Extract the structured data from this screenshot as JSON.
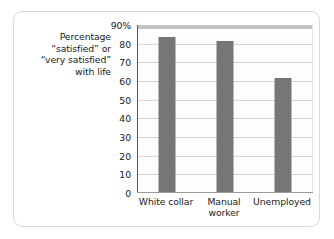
{
  "chart_data": {
    "type": "bar",
    "title": "",
    "subtitle": "",
    "xlabel": "",
    "ylabel": "Percentage “satisfied” or “very satisfied” with life",
    "ylabel_lines": [
      "Percentage",
      "“satisfied” or",
      "“very satisfied”",
      "with life"
    ],
    "categories": [
      "White collar",
      "Manual worker",
      "Unemployed"
    ],
    "category_label_lines": [
      [
        "White collar"
      ],
      [
        "Manual",
        "worker"
      ],
      [
        "Unemployed"
      ]
    ],
    "values": [
      83,
      81,
      61
    ],
    "ylim": [
      0,
      90
    ],
    "yticks": [
      0,
      10,
      20,
      30,
      40,
      50,
      60,
      70,
      80,
      90
    ],
    "ytick_labels": [
      "0",
      "10",
      "20",
      "30",
      "40",
      "50",
      "60",
      "70",
      "80",
      "90%"
    ],
    "grid": true,
    "legend": false,
    "legend_position": "none",
    "colors": {
      "bar": "#767676",
      "gridline": "#d6d6d6",
      "axis": "#555555",
      "plot_background": "#fdfdfd",
      "top_band": "#c3c3c3",
      "card_border": "#d9d9d9",
      "text": "#1a1a1a"
    }
  }
}
